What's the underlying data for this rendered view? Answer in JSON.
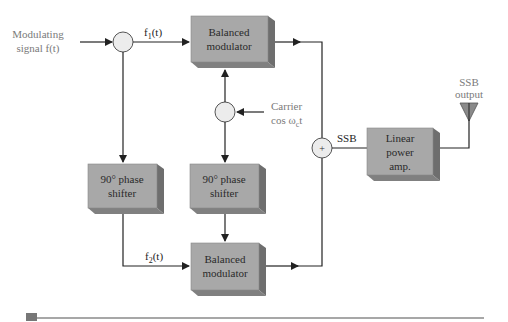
{
  "diagram": {
    "inputs": {
      "modulating_signal": [
        "Modulating",
        "signal f(t)"
      ],
      "carrier": [
        "Carrier",
        "cos ω",
        "c",
        "t"
      ]
    },
    "signals": {
      "f1": {
        "base": "f",
        "sub": "1",
        "rest": "(t)"
      },
      "f2": {
        "base": "f",
        "sub": "2",
        "rest": "(t)"
      },
      "ssb": "SSB"
    },
    "blocks": {
      "balanced_modulator_top": [
        "Balanced",
        "modulator"
      ],
      "balanced_modulator_bottom": [
        "Balanced",
        "modulator"
      ],
      "phase_shifter_left": [
        "90° phase",
        "shifter"
      ],
      "phase_shifter_middle": [
        "90° phase",
        "shifter"
      ],
      "linear_power_amp": [
        "Linear",
        "power",
        "amp."
      ]
    },
    "summer_symbol": "+",
    "output": [
      "SSB",
      "output"
    ],
    "colors": {
      "box_front": "#a8a8a8",
      "box_side": "#6e6e6e",
      "box_bottom": "#808080",
      "line": "#222222",
      "circle_fill": "#ececec",
      "label_gray": "#7a7a7a",
      "rule": "#8a8a8a",
      "rule_square": "#777777"
    }
  }
}
